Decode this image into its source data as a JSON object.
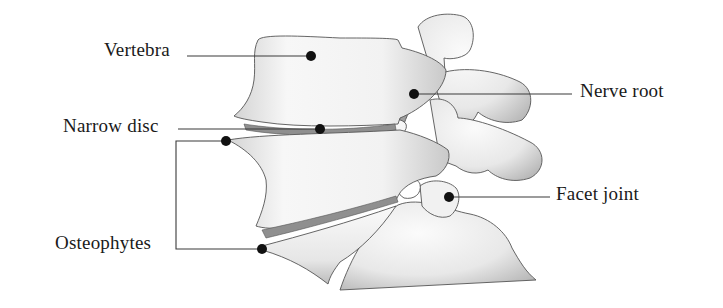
{
  "diagram": {
    "background_color": "#ffffff",
    "leader_line_color": "#3a3a3a",
    "marker_color": "#111111",
    "bone_fill": "#f4f4f4",
    "bone_shadow": "#bdbdbd",
    "labels": [
      {
        "id": "vertebra",
        "text": "Vertebra",
        "side": "left",
        "x": 104,
        "y": 40,
        "marker": [
          311,
          56
        ]
      },
      {
        "id": "narrow-disc",
        "text": "Narrow disc",
        "side": "left",
        "x": 63,
        "y": 116,
        "marker": [
          320,
          129
        ]
      },
      {
        "id": "osteophytes",
        "text": "Osteophytes",
        "side": "left",
        "x": 55,
        "y": 233,
        "markers": [
          [
            226,
            141
          ],
          [
            262,
            249
          ]
        ]
      },
      {
        "id": "nerve-root",
        "text": "Nerve root",
        "side": "right",
        "x": 580,
        "y": 81,
        "marker": [
          414,
          94
        ]
      },
      {
        "id": "facet-joint",
        "text": "Facet joint",
        "side": "right",
        "x": 556,
        "y": 184,
        "marker": [
          449,
          197
        ]
      }
    ]
  }
}
